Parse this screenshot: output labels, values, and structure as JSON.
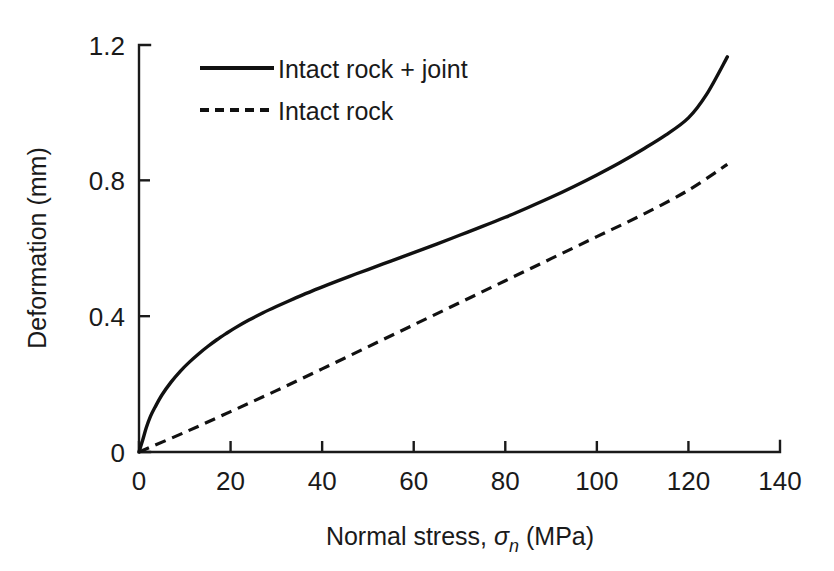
{
  "chart_data": {
    "type": "line",
    "title": "",
    "xlabel": "Normal stress, σn (MPa)",
    "xlabel_prefix": "Normal stress, ",
    "xlabel_symbol": "σ",
    "xlabel_subscript": "n",
    "xlabel_suffix": " (MPa)",
    "ylabel": "Deformation (mm)",
    "xlim": [
      0,
      140
    ],
    "ylim": [
      0,
      1.2
    ],
    "xticks": [
      0,
      20,
      40,
      60,
      80,
      100,
      120,
      140
    ],
    "xtick_labels": [
      "0",
      "20",
      "40",
      "60",
      "80",
      "100",
      "120",
      "140"
    ],
    "yticks": [
      0,
      0.4,
      0.8,
      1.2
    ],
    "ytick_labels": [
      "0",
      "0.4",
      "0.8",
      "1.2"
    ],
    "grid": false,
    "legend_position": "top-left-inside",
    "series": [
      {
        "name": "Intact rock + joint",
        "style": "solid",
        "color": "#111111",
        "x": [
          0,
          0.8,
          1.6,
          2.5,
          3.5,
          5,
          7,
          9,
          11,
          13,
          15,
          17,
          19,
          21,
          24,
          27,
          30,
          34,
          38,
          42,
          46,
          50,
          55,
          60,
          65,
          70,
          75,
          80,
          85,
          90,
          95,
          100,
          105,
          110,
          115,
          120,
          124,
          128.5
        ],
        "y": [
          0,
          0.035,
          0.072,
          0.105,
          0.132,
          0.168,
          0.206,
          0.238,
          0.265,
          0.289,
          0.311,
          0.331,
          0.349,
          0.366,
          0.389,
          0.41,
          0.429,
          0.453,
          0.476,
          0.497,
          0.518,
          0.538,
          0.563,
          0.588,
          0.613,
          0.639,
          0.665,
          0.692,
          0.721,
          0.751,
          0.783,
          0.817,
          0.853,
          0.892,
          0.934,
          0.985,
          1.055,
          1.165
        ]
      },
      {
        "name": "Intact rock",
        "style": "dashed",
        "color": "#111111",
        "x": [
          0,
          10,
          20,
          30,
          40,
          50,
          60,
          70,
          80,
          90,
          100,
          110,
          120,
          128.5
        ],
        "y": [
          0,
          0.058,
          0.119,
          0.181,
          0.245,
          0.31,
          0.375,
          0.44,
          0.505,
          0.57,
          0.635,
          0.7,
          0.772,
          0.848
        ]
      }
    ]
  },
  "legend": {
    "items": [
      {
        "label": "Intact rock + joint",
        "style": "solid"
      },
      {
        "label": "Intact rock",
        "style": "dashed"
      }
    ]
  },
  "axes": {
    "y_title": "Deformation (mm)"
  }
}
